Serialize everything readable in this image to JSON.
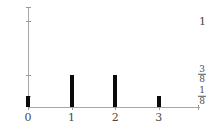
{
  "chart_data": {
    "type": "bar",
    "title": "",
    "subtitle": "",
    "xlabel": "",
    "ylabel": "",
    "categories": [
      "0",
      "1",
      "2",
      "3"
    ],
    "x": [
      0,
      1,
      2,
      3
    ],
    "values": [
      0.125,
      0.375,
      0.375,
      0.125
    ],
    "value_labels": [
      "1/8",
      "3/8",
      "3/8",
      "1/8"
    ],
    "xlim": [
      0,
      3.9
    ],
    "ylim": [
      0,
      1.1
    ],
    "grid": false,
    "legend": null,
    "annotations": [],
    "bar_color": "#0a0a0a",
    "axis_color": "#a8a8a8",
    "x_ticks": [
      {
        "value": 0,
        "label": "0"
      },
      {
        "value": 1,
        "label": "1"
      },
      {
        "value": 2,
        "label": "2"
      },
      {
        "value": 3,
        "label": "3"
      }
    ],
    "y_ticks": [
      {
        "value": 0.125,
        "label": "1/8",
        "numerator": "1",
        "denominator": "8",
        "is_fraction": true
      },
      {
        "value": 0.375,
        "label": "3/8",
        "numerator": "3",
        "denominator": "8",
        "is_fraction": true
      },
      {
        "value": 1,
        "label": "1",
        "numerator": "",
        "denominator": "",
        "is_fraction": false
      }
    ]
  }
}
